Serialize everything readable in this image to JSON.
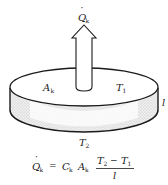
{
  "diagram": {
    "heat_flow_label": {
      "main": "Q",
      "sub": "k",
      "dot": "·"
    },
    "area_label": {
      "main": "A",
      "sub": "k"
    },
    "top_temperature_label": {
      "main": "T",
      "sub": "1"
    },
    "bottom_temperature_label": {
      "main": "T",
      "sub": "2"
    },
    "thickness_label": "l",
    "equation": {
      "lhs_main": "Q",
      "lhs_sub": "k",
      "equals": "=",
      "coef_main": "C",
      "coef_sub": "k",
      "area_main": "A",
      "area_sub": "k",
      "numerator_a_main": "T",
      "numerator_a_sub": "2",
      "minus": "−",
      "numerator_b_main": "T",
      "numerator_b_sub": "1",
      "denominator": "l"
    },
    "colors": {
      "stroke": "#1a1a1a",
      "side_fill": "#e4e4e4",
      "top_fill": "#ffffff"
    }
  }
}
